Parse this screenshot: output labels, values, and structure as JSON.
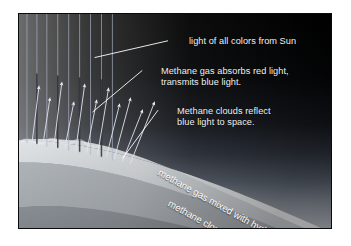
{
  "figure": {
    "kind": "atmosphere-light-scattering-diagram",
    "background_color": "#ffffff",
    "panel_background": "#000000"
  },
  "labels": {
    "sunlight": "light of all colors from Sun",
    "absorption_line1": "Methane gas absorbs red light,",
    "absorption_line2": "transmits blue light.",
    "reflection_line1": "Methane clouds reflect",
    "reflection_line2": "blue light to space.",
    "gas_layer": "methane gas mixed with hydrogen",
    "cloud_layer": "methane clouds"
  },
  "colors": {
    "label_text": "#f2f2f2",
    "curved_label_text": "#ffffff",
    "leader_line": "#ffffff",
    "incoming_ray": "#b9c4d6",
    "outgoing_ray": "#e8edf5",
    "space": "#000000",
    "haze_top": "#6e7a8c",
    "cloud_top": "#d9dde2",
    "mid_layer": "#a8adb3",
    "deep_layer": "#8b9096"
  },
  "elements": {
    "incoming_rays_count": 9,
    "outgoing_arrows_count": 11,
    "leader_lines_count": 3,
    "atmosphere_bands": 3
  }
}
